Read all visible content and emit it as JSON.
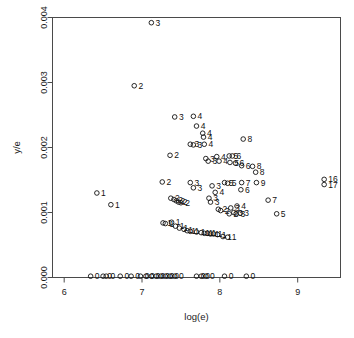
{
  "chart_data": {
    "type": "scatter",
    "title": "",
    "xlabel": "log(e)",
    "ylabel": "y/e",
    "xlim": [
      5.85,
      9.55
    ],
    "ylim": [
      0,
      0.004
    ],
    "xticks": [
      6,
      7,
      8,
      9
    ],
    "xtick_labels": [
      "6",
      "7",
      "8",
      "9"
    ],
    "yticks": [
      0.0,
      0.001,
      0.002,
      0.003,
      0.004
    ],
    "ytick_labels": [
      "0.000",
      "0.001",
      "0.002",
      "0.003",
      "0.004"
    ],
    "grid": false,
    "legend": false,
    "marker": "open-circle",
    "point_label_field": "count",
    "points": [
      {
        "x": 7.12,
        "y": 0.00392,
        "label": "3"
      },
      {
        "x": 6.9,
        "y": 0.00295,
        "label": "2"
      },
      {
        "x": 7.42,
        "y": 0.00247,
        "label": "3"
      },
      {
        "x": 7.66,
        "y": 0.00248,
        "label": "4"
      },
      {
        "x": 7.7,
        "y": 0.00233,
        "label": "4"
      },
      {
        "x": 7.78,
        "y": 0.00222,
        "label": "4"
      },
      {
        "x": 7.79,
        "y": 0.00216,
        "label": "4"
      },
      {
        "x": 7.62,
        "y": 0.00205,
        "label": "3"
      },
      {
        "x": 7.66,
        "y": 0.00204,
        "label": "3"
      },
      {
        "x": 7.8,
        "y": 0.00205,
        "label": "4"
      },
      {
        "x": 8.3,
        "y": 0.00213,
        "label": "8"
      },
      {
        "x": 7.36,
        "y": 0.00188,
        "label": "2"
      },
      {
        "x": 7.82,
        "y": 0.00183,
        "label": "3"
      },
      {
        "x": 7.85,
        "y": 0.00179,
        "label": "3"
      },
      {
        "x": 7.96,
        "y": 0.00186,
        "label": "4"
      },
      {
        "x": 7.99,
        "y": 0.00179,
        "label": "4"
      },
      {
        "x": 8.12,
        "y": 0.00187,
        "label": "5"
      },
      {
        "x": 8.16,
        "y": 0.00187,
        "label": "6"
      },
      {
        "x": 8.13,
        "y": 0.00177,
        "label": "5"
      },
      {
        "x": 8.2,
        "y": 0.00176,
        "label": "6"
      },
      {
        "x": 8.28,
        "y": 0.00172,
        "label": "6"
      },
      {
        "x": 8.42,
        "y": 0.00171,
        "label": "8"
      },
      {
        "x": 8.46,
        "y": 0.00162,
        "label": "8"
      },
      {
        "x": 9.34,
        "y": 0.00151,
        "label": "16"
      },
      {
        "x": 9.34,
        "y": 0.00143,
        "label": "17"
      },
      {
        "x": 7.26,
        "y": 0.00147,
        "label": "2"
      },
      {
        "x": 7.62,
        "y": 0.00146,
        "label": "3"
      },
      {
        "x": 7.66,
        "y": 0.00138,
        "label": "3"
      },
      {
        "x": 7.9,
        "y": 0.00141,
        "label": "3"
      },
      {
        "x": 7.94,
        "y": 0.00131,
        "label": "4"
      },
      {
        "x": 8.1,
        "y": 0.00145,
        "label": "5"
      },
      {
        "x": 8.06,
        "y": 0.00146,
        "label": "5"
      },
      {
        "x": 8.28,
        "y": 0.00146,
        "label": "7"
      },
      {
        "x": 8.47,
        "y": 0.00146,
        "label": "9"
      },
      {
        "x": 8.27,
        "y": 0.00135,
        "label": "6"
      },
      {
        "x": 6.42,
        "y": 0.0013,
        "label": "1"
      },
      {
        "x": 7.37,
        "y": 0.00122,
        "label": "2"
      },
      {
        "x": 7.41,
        "y": 0.0012,
        "label": "2"
      },
      {
        "x": 7.44,
        "y": 0.00118,
        "label": "2"
      },
      {
        "x": 7.47,
        "y": 0.00116,
        "label": "2"
      },
      {
        "x": 7.5,
        "y": 0.00115,
        "label": "2"
      },
      {
        "x": 7.86,
        "y": 0.00122,
        "label": "3"
      },
      {
        "x": 7.88,
        "y": 0.00116,
        "label": "3"
      },
      {
        "x": 8.62,
        "y": 0.00119,
        "label": "7"
      },
      {
        "x": 6.6,
        "y": 0.00112,
        "label": "1"
      },
      {
        "x": 7.98,
        "y": 0.00105,
        "label": "2"
      },
      {
        "x": 8.01,
        "y": 0.00103,
        "label": "2"
      },
      {
        "x": 8.14,
        "y": 0.00107,
        "label": "3"
      },
      {
        "x": 8.22,
        "y": 0.0011,
        "label": "4"
      },
      {
        "x": 8.18,
        "y": 0.001,
        "label": "3"
      },
      {
        "x": 8.21,
        "y": 0.00098,
        "label": "3"
      },
      {
        "x": 8.26,
        "y": 0.00099,
        "label": "3"
      },
      {
        "x": 8.12,
        "y": 0.00098,
        "label": "2"
      },
      {
        "x": 8.73,
        "y": 0.00098,
        "label": "5"
      },
      {
        "x": 7.27,
        "y": 0.00084,
        "label": "1"
      },
      {
        "x": 7.3,
        "y": 0.00083,
        "label": "1"
      },
      {
        "x": 7.38,
        "y": 0.00085,
        "label": "1"
      },
      {
        "x": 7.43,
        "y": 0.00079,
        "label": "1"
      },
      {
        "x": 7.48,
        "y": 0.00076,
        "label": "1"
      },
      {
        "x": 7.54,
        "y": 0.00074,
        "label": "1"
      },
      {
        "x": 7.58,
        "y": 0.00072,
        "label": "1"
      },
      {
        "x": 7.62,
        "y": 0.00071,
        "label": "1"
      },
      {
        "x": 7.7,
        "y": 0.0007,
        "label": "1"
      },
      {
        "x": 7.76,
        "y": 0.00069,
        "label": "1"
      },
      {
        "x": 7.8,
        "y": 0.00068,
        "label": "1"
      },
      {
        "x": 7.84,
        "y": 0.00068,
        "label": "1"
      },
      {
        "x": 7.88,
        "y": 0.00067,
        "label": "1"
      },
      {
        "x": 7.92,
        "y": 0.00067,
        "label": "1"
      },
      {
        "x": 7.97,
        "y": 0.00066,
        "label": "1"
      },
      {
        "x": 8.04,
        "y": 0.00063,
        "label": "1"
      },
      {
        "x": 8.1,
        "y": 0.00062,
        "label": "1"
      },
      {
        "x": 6.34,
        "y": 2e-05,
        "label": "0"
      },
      {
        "x": 6.5,
        "y": 2e-05,
        "label": "0"
      },
      {
        "x": 6.54,
        "y": 2e-05,
        "label": "0"
      },
      {
        "x": 6.72,
        "y": 2e-05,
        "label": "0"
      },
      {
        "x": 6.86,
        "y": 2e-05,
        "label": "0"
      },
      {
        "x": 6.98,
        "y": 2e-05,
        "label": "0"
      },
      {
        "x": 7.05,
        "y": 2e-05,
        "label": "0"
      },
      {
        "x": 7.12,
        "y": 2e-05,
        "label": "0"
      },
      {
        "x": 7.18,
        "y": 2e-05,
        "label": "0"
      },
      {
        "x": 7.24,
        "y": 2e-05,
        "label": "0"
      },
      {
        "x": 7.3,
        "y": 2e-05,
        "label": "0"
      },
      {
        "x": 7.36,
        "y": 2e-05,
        "label": "0"
      },
      {
        "x": 7.42,
        "y": 2e-05,
        "label": "0"
      },
      {
        "x": 7.7,
        "y": 2e-05,
        "label": "0"
      },
      {
        "x": 7.76,
        "y": 2e-05,
        "label": "0"
      },
      {
        "x": 7.82,
        "y": 2e-05,
        "label": "0"
      },
      {
        "x": 8.06,
        "y": 2e-05,
        "label": "0"
      },
      {
        "x": 8.34,
        "y": 2e-05,
        "label": "0"
      }
    ]
  }
}
